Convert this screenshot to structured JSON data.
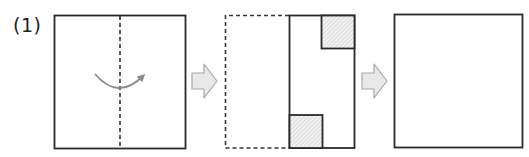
{
  "problem": {
    "label": "(1)"
  },
  "steps": [
    {
      "id": "step-1",
      "description": "Square paper with vertical dashed fold line at center; curved arrow indicates folding left half over to the right",
      "shape": "square",
      "fold_line": "vertical-center-dashed",
      "arrow": "curved-left-to-right"
    },
    {
      "id": "step-2",
      "description": "Folded paper: dashed outline of original left half, solid right half with two hatched squares cut out (top-right and bottom-left of folded strip)",
      "shape": "folded-half",
      "cutouts": [
        {
          "position": "top-right",
          "style": "hatched"
        },
        {
          "position": "bottom-left",
          "style": "hatched"
        }
      ]
    },
    {
      "id": "step-3",
      "description": "Blank square for the unfolded result (answer area)",
      "shape": "square",
      "content": "empty"
    }
  ],
  "transition_arrows": [
    {
      "from": "step-1",
      "to": "step-2"
    },
    {
      "from": "step-2",
      "to": "step-3"
    }
  ],
  "colors": {
    "outline": "#2a2a2a",
    "dashed": "#333333",
    "curved_arrow": "#8c8c8c",
    "block_arrow_fill": "#e8e8e8",
    "block_arrow_stroke": "#a8a8a8",
    "hatch_fill": "#f0f0f0",
    "hatch_line": "#c4c4c4"
  }
}
